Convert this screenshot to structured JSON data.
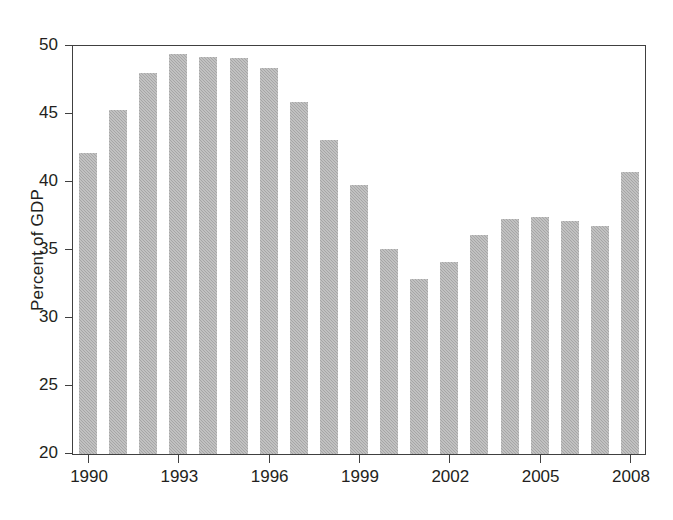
{
  "chart_data": {
    "type": "bar",
    "title": "",
    "subtitle": "",
    "xlabel": "",
    "ylabel": "Percent of GDP",
    "ylim": [
      20,
      50
    ],
    "yticks": [
      20,
      25,
      30,
      35,
      40,
      45,
      50
    ],
    "ytick_labels": [
      "20",
      "25",
      "30",
      "35",
      "40",
      "45",
      "50"
    ],
    "xticks": [
      1990,
      1993,
      1996,
      1999,
      2002,
      2005,
      2008
    ],
    "xtick_labels": [
      "1990",
      "1993",
      "1996",
      "1999",
      "2002",
      "2005",
      "2008"
    ],
    "grid": false,
    "legend": null,
    "bar_color": "#a6a6a6",
    "axis_color": "#404040",
    "categories": [
      "1990",
      "1991",
      "1992",
      "1993",
      "1994",
      "1995",
      "1996",
      "1997",
      "1998",
      "1999",
      "2000",
      "2001",
      "2002",
      "2003",
      "2004",
      "2005",
      "2006",
      "2007",
      "2008"
    ],
    "values": [
      42.1,
      45.3,
      48.0,
      49.4,
      49.2,
      49.1,
      48.4,
      45.9,
      43.1,
      39.8,
      35.1,
      32.9,
      34.1,
      36.1,
      37.3,
      37.4,
      37.1,
      36.8,
      40.7
    ]
  }
}
